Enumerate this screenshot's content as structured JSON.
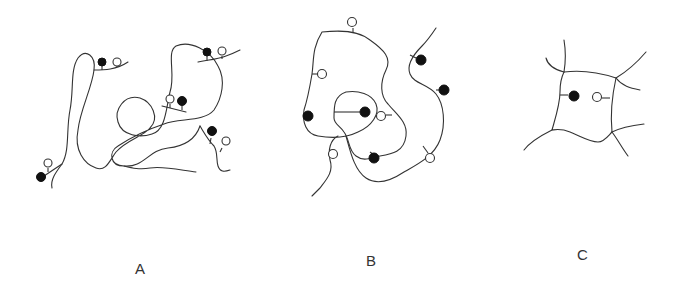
{
  "figure": {
    "panels": [
      {
        "id": "A",
        "label": "A",
        "description": "Single polymer chain, loosely coiled, with pendant filled and open groups on short side branches"
      },
      {
        "id": "B",
        "label": "B",
        "description": "Collapsed chain with filled and open pendant groups pointing inward and outward"
      },
      {
        "id": "C",
        "label": "C",
        "description": "Crosslinked network cell with one filled and one open pendant group facing each other"
      }
    ],
    "legend": {
      "filled_circle": "filled pendant group",
      "open_circle": "open pendant group"
    },
    "colors": {
      "line": "#333333",
      "filled": "#111111",
      "background": "#ffffff"
    }
  }
}
